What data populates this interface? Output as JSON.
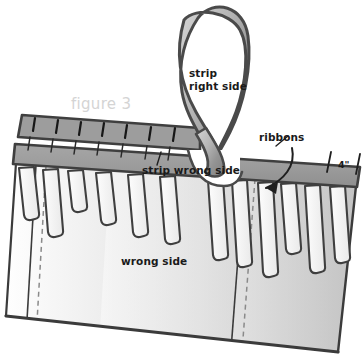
{
  "figure": {
    "caption": "figure 3",
    "caption_color": "#d4d4d4"
  },
  "labels": {
    "strip_right_side_line1": "strip",
    "strip_right_side_line2": "right side",
    "strip_wrong_side": "strip wrong side",
    "ribbons": "ribbons",
    "wrong_side": "wrong side",
    "measurement": "4\""
  },
  "colors": {
    "outline": "#4a4a4a",
    "outline_dark": "#3b3b3b",
    "strip_band_fill": "#9a9a9a",
    "strip_curl_fill_light": "#c2c2c2",
    "strip_curl_fill_dark": "#8e8e8e",
    "fabric_fill_light": "#fbfbfb",
    "fabric_fill_mid": "#e8e8e8",
    "fabric_fill_dark": "#c9c9c9",
    "slot_fill": "#f2f2f2",
    "stitch_dash": "#8a8a8a",
    "tick_mark": "#1f1f1f",
    "background": "#ffffff",
    "text": "#1a1a1a"
  },
  "geometry": {
    "stitch_tick_count": 8,
    "ribbon_slot_count": 12,
    "measurement_tick_count": 2
  }
}
